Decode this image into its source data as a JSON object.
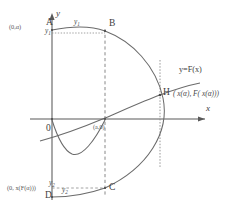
{
  "figure": {
    "kind": "mathematical-diagram",
    "background_color": "#ffffff",
    "ink_color": "#555555",
    "axes": {
      "x_axis_label": "x",
      "y_axis_label": "y",
      "origin_label": "0"
    },
    "points": {
      "A": "A",
      "B": "B",
      "C": "C",
      "D": "D",
      "H": "H"
    },
    "labels": {
      "alpha_coord": "(0,α)",
      "y1_axis_tick": "y",
      "y1_sub": "1",
      "y1_curve": "y",
      "y1_curve_sub": "1",
      "a_zero": "(a,0)",
      "y2_axis_tick": "y",
      "y2_sub": "2",
      "y2_curve": "y",
      "y2_curve_sub": "2",
      "bottom_coord": "(0, x(F(α)))",
      "function_label": "y=F(x)",
      "h_expr": "( x(α), F( x(α)))"
    }
  }
}
